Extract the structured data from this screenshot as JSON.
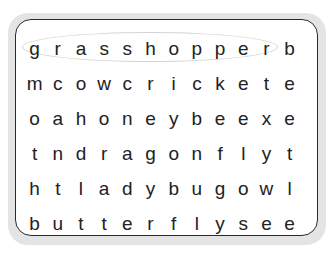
{
  "puzzle": {
    "type": "word-search",
    "rows": [
      [
        "g",
        "r",
        "a",
        "s",
        "s",
        "h",
        "o",
        "p",
        "p",
        "e",
        "r",
        "b"
      ],
      [
        "m",
        "c",
        "o",
        "w",
        "c",
        "r",
        "i",
        "c",
        "k",
        "e",
        "t",
        "e"
      ],
      [
        "o",
        "a",
        "h",
        "o",
        "n",
        "e",
        "y",
        "b",
        "e",
        "e",
        "x",
        "e"
      ],
      [
        "t",
        "n",
        "d",
        "r",
        "a",
        "g",
        "o",
        "n",
        "f",
        "l",
        "y",
        "t"
      ],
      [
        "h",
        "t",
        "l",
        "a",
        "d",
        "y",
        "b",
        "u",
        "g",
        "o",
        "w",
        "l"
      ],
      [
        "b",
        "u",
        "t",
        "t",
        "e",
        "r",
        "f",
        "l",
        "y",
        "s",
        "e",
        "e"
      ]
    ],
    "found_words": [
      {
        "word": "grasshopper",
        "row": 0,
        "start_col": 0,
        "end_col": 10
      }
    ],
    "colors": {
      "frame": "#e4e4e4",
      "border": "#2a2a2a",
      "letters": "#222222",
      "highlight": "#d4d4d4"
    }
  }
}
